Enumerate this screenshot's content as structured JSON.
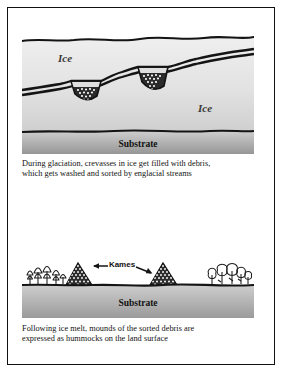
{
  "figure": {
    "panels": [
      {
        "id": "glaciation",
        "labels": {
          "ice_left": "Ice",
          "ice_right": "Ice",
          "substrate": "Substrate"
        },
        "caption_lines": [
          "During glaciation, crevasses in ice get filled with debris,",
          "which gets washed and sorted by englacial streams"
        ]
      },
      {
        "id": "postmelt",
        "labels": {
          "kames": "Kames",
          "substrate": "Substrate"
        },
        "caption_lines": [
          "Following ice melt, mounds of the sorted debris are",
          "expressed as hummocks on the land surface"
        ]
      }
    ]
  },
  "colors": {
    "ink": "#111111",
    "ice_light": "#eeeeee",
    "ice_shade": "#d2d2d2",
    "substrate_light": "#c9c9c9",
    "substrate_dark": "#9a9a9a",
    "debris_dark": "#2b2b2b",
    "debris_speck": "#ffffff",
    "frame": "#111111",
    "page": "#ffffff"
  }
}
